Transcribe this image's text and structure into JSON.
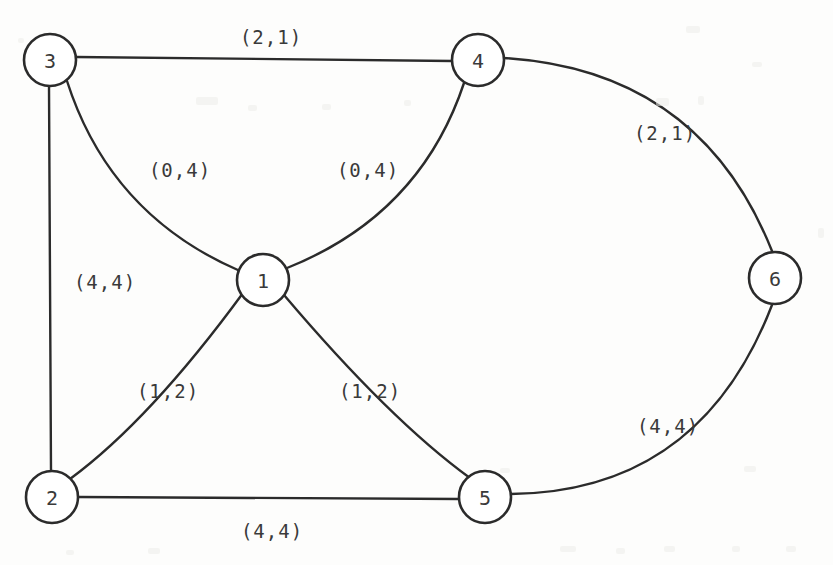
{
  "figure": {
    "kind": "undirected-graph-diagram",
    "background_color": "#fdfdfc",
    "stroke_color": "#2b2b2b",
    "text_color": "#3a3a3a",
    "width": 833,
    "height": 565
  },
  "nodes": [
    {
      "id": "1",
      "label": "1",
      "cx": 263,
      "cy": 280,
      "r": 26
    },
    {
      "id": "2",
      "label": "2",
      "cx": 52,
      "cy": 497,
      "r": 26
    },
    {
      "id": "3",
      "label": "3",
      "cx": 50,
      "cy": 60,
      "r": 26
    },
    {
      "id": "4",
      "label": "4",
      "cx": 478,
      "cy": 60,
      "r": 26
    },
    {
      "id": "5",
      "label": "5",
      "cx": 485,
      "cy": 497,
      "r": 26
    },
    {
      "id": "6",
      "label": "6",
      "cx": 775,
      "cy": 278,
      "r": 26
    }
  ],
  "edges": [
    {
      "id": "e-3-4",
      "from": "3",
      "to": "4",
      "label": "(2,1)",
      "label_x": 271,
      "label_y": 37,
      "path": "M 76 57 L 452 61"
    },
    {
      "id": "e-3-1",
      "from": "3",
      "to": "1",
      "label": "(0,4)",
      "label_x": 180,
      "label_y": 170,
      "path": "M 67 81 Q 110 215 240 271"
    },
    {
      "id": "e-1-4",
      "from": "1",
      "to": "4",
      "label": "(0,4)",
      "label_x": 368,
      "label_y": 170,
      "path": "M 287 268 Q 420 215 464 83"
    },
    {
      "id": "e-3-2",
      "from": "3",
      "to": "2",
      "label": "(4,4)",
      "label_x": 105,
      "label_y": 282,
      "path": "M 49 86 L 51 471"
    },
    {
      "id": "e-2-1",
      "from": "2",
      "to": "1",
      "label": "(1,2)",
      "label_x": 168,
      "label_y": 391,
      "path": "M 70 479 Q 150 420 243 293"
    },
    {
      "id": "e-1-5",
      "from": "1",
      "to": "5",
      "label": "(1,2)",
      "label_x": 370,
      "label_y": 391,
      "path": "M 284 295 Q 390 420 470 478"
    },
    {
      "id": "e-2-5",
      "from": "2",
      "to": "5",
      "label": "(4,4)",
      "label_x": 272,
      "label_y": 531,
      "path": "M 78 497 L 459 499"
    },
    {
      "id": "e-4-6",
      "from": "4",
      "to": "6",
      "label": "(2,1)",
      "label_x": 665,
      "label_y": 133,
      "path": "M 504 58 Q 700 70 772 251"
    },
    {
      "id": "e-5-6",
      "from": "5",
      "to": "6",
      "label": "(4,4)",
      "label_x": 668,
      "label_y": 426,
      "path": "M 511 494 Q 700 492 772 305"
    }
  ],
  "speckles": [
    {
      "x": 686,
      "y": 26,
      "w": 14,
      "h": 7
    },
    {
      "x": 752,
      "y": 62,
      "w": 10,
      "h": 5
    },
    {
      "x": 18,
      "y": 38,
      "w": 6,
      "h": 5
    },
    {
      "x": 196,
      "y": 97,
      "w": 22,
      "h": 8
    },
    {
      "x": 248,
      "y": 105,
      "w": 9,
      "h": 6
    },
    {
      "x": 322,
      "y": 104,
      "w": 9,
      "h": 6
    },
    {
      "x": 404,
      "y": 100,
      "w": 7,
      "h": 6
    },
    {
      "x": 656,
      "y": 98,
      "w": 13,
      "h": 8
    },
    {
      "x": 698,
      "y": 96,
      "w": 6,
      "h": 9
    },
    {
      "x": 560,
      "y": 546,
      "w": 16,
      "h": 6
    },
    {
      "x": 616,
      "y": 548,
      "w": 9,
      "h": 6
    },
    {
      "x": 664,
      "y": 546,
      "w": 11,
      "h": 6
    },
    {
      "x": 732,
      "y": 546,
      "w": 8,
      "h": 6
    },
    {
      "x": 786,
      "y": 546,
      "w": 10,
      "h": 6
    },
    {
      "x": 148,
      "y": 548,
      "w": 12,
      "h": 6
    },
    {
      "x": 66,
      "y": 550,
      "w": 8,
      "h": 5
    },
    {
      "x": 818,
      "y": 228,
      "w": 6,
      "h": 10
    },
    {
      "x": 500,
      "y": 468,
      "w": 10,
      "h": 5
    },
    {
      "x": 744,
      "y": 466,
      "w": 12,
      "h": 6
    }
  ]
}
